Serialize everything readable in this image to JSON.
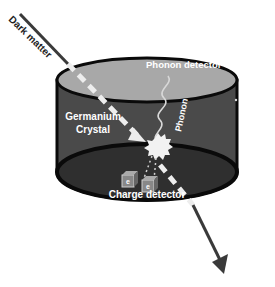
{
  "diagram": {
    "labels": {
      "dark_matter": "Dark matter",
      "phonon_detector": "Phonon detector",
      "phonon": "Phonon",
      "germanium_crystal_line1": "Germanium",
      "germanium_crystal_line2": "Crystal",
      "charge_detector": "Charge detector",
      "charge_symbol_1": "e",
      "charge_symbol_2": "e"
    },
    "colors": {
      "cylinder_body": "#4a4a4a",
      "cylinder_top": "#a8a8a8",
      "cylinder_bottom": "#2f2f2f",
      "outline": "#0a0a0a",
      "track": "#ededed",
      "arrow": "#3a3a3a",
      "collision_flash": "#f2f2f2"
    },
    "components": [
      {
        "id": "dark-matter-track",
        "type": "arrow",
        "from": "top-left",
        "to": "bottom-right"
      },
      {
        "id": "germanium-crystal",
        "type": "cylinder"
      },
      {
        "id": "phonon-detector",
        "type": "surface",
        "position": "top"
      },
      {
        "id": "phonon",
        "type": "wave",
        "from": "collision",
        "to": "phonon-detector"
      },
      {
        "id": "collision",
        "type": "flash"
      },
      {
        "id": "charge-detector",
        "type": "pair-of-cubes",
        "position": "bottom"
      }
    ]
  }
}
